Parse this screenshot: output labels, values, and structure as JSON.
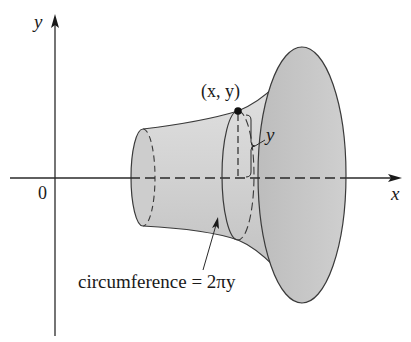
{
  "figure": {
    "type": "surface-of-revolution-diagram",
    "axes": {
      "x_label": "x",
      "y_label": "y",
      "origin_label": "0"
    },
    "annotations": {
      "point_label": "(x, y)",
      "radius_label": "y",
      "circumference_label": "circumference = 2πy"
    },
    "colors": {
      "line": "#2a2a2a",
      "surface_fill": "#d9d9d9",
      "end_cap_fill": "#bdbdbd",
      "background": "#ffffff"
    }
  }
}
